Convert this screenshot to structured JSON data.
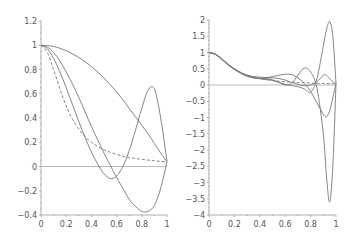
{
  "chart_data": [
    {
      "type": "line",
      "title": "",
      "xlabel": "",
      "ylabel": "",
      "xlim": [
        0,
        1
      ],
      "ylim": [
        -0.4,
        1.2
      ],
      "xticks": [
        "0",
        "0.2",
        "0.4",
        "0.6",
        "0.8",
        "1"
      ],
      "yticks": [
        "-0.4",
        "-0.2",
        "0",
        "0.2",
        "0.4",
        "0.6",
        "0.8",
        "1",
        "1.2"
      ],
      "x": [
        0,
        0.05,
        0.1,
        0.15,
        0.2,
        0.25,
        0.3,
        0.35,
        0.4,
        0.45,
        0.5,
        0.55,
        0.6,
        0.65,
        0.7,
        0.75,
        0.8,
        0.85,
        0.9,
        0.95,
        1
      ],
      "series": [
        {
          "name": "curve-1",
          "style": "solid",
          "values": [
            1,
            0.997,
            0.99,
            0.975,
            0.955,
            0.93,
            0.9,
            0.865,
            0.825,
            0.78,
            0.73,
            0.675,
            0.615,
            0.55,
            0.48,
            0.41,
            0.34,
            0.27,
            0.19,
            0.11,
            0.04
          ]
        },
        {
          "name": "curve-2",
          "style": "solid",
          "values": [
            1,
            0.97,
            0.89,
            0.78,
            0.65,
            0.51,
            0.37,
            0.24,
            0.12,
            0.02,
            -0.06,
            -0.1,
            -0.08,
            0.0,
            0.13,
            0.3,
            0.48,
            0.63,
            0.64,
            0.4,
            0.04
          ]
        },
        {
          "name": "curve-3",
          "style": "solid",
          "values": [
            1,
            0.985,
            0.94,
            0.87,
            0.78,
            0.68,
            0.57,
            0.45,
            0.33,
            0.22,
            0.11,
            0.01,
            -0.09,
            -0.18,
            -0.27,
            -0.33,
            -0.37,
            -0.37,
            -0.32,
            -0.18,
            0.04
          ]
        },
        {
          "name": "runge-function",
          "style": "dashed",
          "values": [
            1,
            0.941,
            0.8,
            0.64,
            0.5,
            0.39,
            0.308,
            0.246,
            0.2,
            0.165,
            0.138,
            0.117,
            0.1,
            0.086,
            0.075,
            0.066,
            0.059,
            0.053,
            0.047,
            0.042,
            0.038
          ]
        }
      ]
    },
    {
      "type": "line",
      "title": "",
      "xlabel": "",
      "ylabel": "",
      "xlim": [
        0,
        1
      ],
      "ylim": [
        -4,
        2
      ],
      "xticks": [
        "0",
        "0.2",
        "0.4",
        "0.6",
        "0.8",
        "1"
      ],
      "yticks": [
        "-4",
        "-3.5",
        "-3",
        "-2.5",
        "-2",
        "-1.5",
        "-1",
        "-0.5",
        "0",
        "0.5",
        "1",
        "1.5",
        "2"
      ],
      "x": [
        0,
        0.05,
        0.1,
        0.15,
        0.2,
        0.25,
        0.3,
        0.35,
        0.4,
        0.45,
        0.5,
        0.55,
        0.6,
        0.65,
        0.7,
        0.75,
        0.8,
        0.85,
        0.9,
        0.925,
        0.95,
        0.975,
        1
      ],
      "series": [
        {
          "name": "curve-1",
          "style": "solid",
          "values": [
            1,
            0.95,
            0.8,
            0.63,
            0.49,
            0.38,
            0.3,
            0.26,
            0.24,
            0.23,
            0.22,
            0.2,
            0.15,
            0.08,
            0.02,
            -0.02,
            0.0,
            0.1,
            0.3,
            0.3,
            0.2,
            0.1,
            0.04
          ]
        },
        {
          "name": "curve-2",
          "style": "solid",
          "values": [
            1,
            0.94,
            0.79,
            0.62,
            0.48,
            0.37,
            0.28,
            0.22,
            0.2,
            0.22,
            0.26,
            0.3,
            0.33,
            0.32,
            0.22,
            0.05,
            -0.2,
            -0.55,
            -0.9,
            -0.98,
            -0.8,
            -0.4,
            0.04
          ]
        },
        {
          "name": "curve-3",
          "style": "solid",
          "values": [
            1,
            0.94,
            0.8,
            0.63,
            0.48,
            0.36,
            0.27,
            0.22,
            0.21,
            0.2,
            0.16,
            0.08,
            0.0,
            0.05,
            0.3,
            0.52,
            0.4,
            -0.1,
            -1.5,
            -2.8,
            -3.6,
            -2.5,
            0.04
          ]
        },
        {
          "name": "curve-4",
          "style": "solid",
          "values": [
            1,
            0.95,
            0.81,
            0.64,
            0.5,
            0.38,
            0.29,
            0.23,
            0.19,
            0.17,
            0.14,
            0.08,
            0.02,
            -0.02,
            -0.05,
            -0.12,
            -0.22,
            0.2,
            1.2,
            1.7,
            1.95,
            1.5,
            0.04
          ]
        },
        {
          "name": "runge-function",
          "style": "dashed",
          "values": [
            1,
            0.941,
            0.8,
            0.64,
            0.5,
            0.39,
            0.308,
            0.246,
            0.2,
            0.165,
            0.138,
            0.117,
            0.1,
            0.086,
            0.075,
            0.066,
            0.059,
            0.053,
            0.047,
            0.044,
            0.042,
            0.04,
            0.038
          ]
        }
      ]
    }
  ]
}
